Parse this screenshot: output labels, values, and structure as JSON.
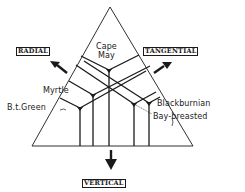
{
  "diagram": {
    "axes": {
      "radial": "RADIAL",
      "tangential": "TANGENTIAL",
      "vertical": "VERTICAL"
    },
    "species": [
      {
        "name": "Cape May",
        "line1": "Cape",
        "line2": "May"
      },
      {
        "name": "Myrtle"
      },
      {
        "name": "B.t.Green"
      },
      {
        "name": "Blackburnian"
      },
      {
        "name": "Bay-breasted"
      }
    ],
    "colors": {
      "ink": "#1a1a1a",
      "background": "#ffffff"
    }
  }
}
